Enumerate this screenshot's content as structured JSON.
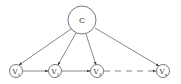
{
  "diagram": {
    "type": "directed-graph",
    "nodes": [
      {
        "id": "C",
        "label": "C",
        "sub": ""
      },
      {
        "id": "V1",
        "label": "V",
        "sub": "1"
      },
      {
        "id": "V2",
        "label": "V",
        "sub": "2"
      },
      {
        "id": "V3",
        "label": "V",
        "sub": "3"
      },
      {
        "id": "Vn",
        "label": "V",
        "sub": "n"
      }
    ],
    "edges": [
      {
        "from": "C",
        "to": "V1"
      },
      {
        "from": "C",
        "to": "V2"
      },
      {
        "from": "C",
        "to": "V3"
      },
      {
        "from": "C",
        "to": "Vn"
      },
      {
        "from": "V1",
        "to": "V2"
      },
      {
        "from": "V2",
        "to": "V3"
      },
      {
        "from": "V3",
        "to": "Vn",
        "style": "dashed"
      }
    ]
  }
}
